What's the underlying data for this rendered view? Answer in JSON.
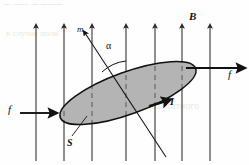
{
  "figure": {
    "width": 249,
    "height": 165,
    "background_color": "#fefefe"
  },
  "labels": {
    "field": "B",
    "moment": "m",
    "angle": "α",
    "force_left": "f",
    "force_right": "f",
    "current": "I",
    "area": "S"
  },
  "colors": {
    "ink": "#111111",
    "loop_fill": "#b2b2b2",
    "loop_stroke": "#111111",
    "field_line": "#2a2a2a",
    "bleed_text": "#d8d4c2"
  },
  "field_lines": {
    "count": 7,
    "direction": "up",
    "x_positions": [
      36,
      64,
      92,
      126,
      155,
      182,
      210
    ],
    "y_top": 24,
    "y_bottom": 161
  },
  "loop": {
    "shape": "ellipse",
    "center_x": 128,
    "center_y": 93,
    "semi_major": 72,
    "semi_minor": 21,
    "rotation_deg": -20,
    "current_direction": "clockwise-in-view"
  },
  "moment_axis": {
    "from_x": 85,
    "from_y": 33,
    "to_x": 166,
    "to_y": 157,
    "arrow_at": "upper-left"
  },
  "angle_arc": {
    "label": "α",
    "vertex_x": 126,
    "vertex_y": 111,
    "label_x": 109,
    "label_y": 46
  },
  "force_arrows": [
    {
      "name": "force-left",
      "x1": 20,
      "y1": 113,
      "x2": 52,
      "y2": 113,
      "label_x": 9,
      "label_y": 107
    },
    {
      "name": "force-right",
      "x1": 186,
      "y1": 68,
      "x2": 240,
      "y2": 68,
      "label_x": 227,
      "label_y": 72
    }
  ],
  "leader_lines": [
    {
      "name": "area-leader",
      "x1": 70,
      "y1": 138,
      "x2": 85,
      "y2": 117
    }
  ],
  "bleed_text": {
    "top_strip": "— ——  — ———",
    "mid_left": "в случае  поля",
    "mid_right": "магнитного"
  }
}
